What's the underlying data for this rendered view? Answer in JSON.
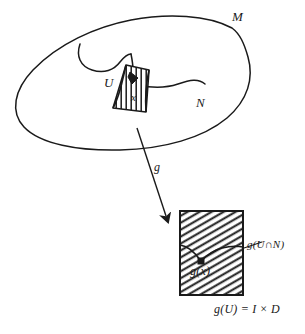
{
  "figure": {
    "title_present": false,
    "background_color": "#ffffff",
    "ink_color": "#1a1a1a",
    "width": 305,
    "height": 334
  },
  "labels": {
    "manifold": "M",
    "submanifold": "N",
    "chart_domain": "U",
    "point": "x",
    "map": "g",
    "image_point": "g(x)",
    "image_intersection": "g(U∩N)",
    "image_equation": "g(U) = I × D"
  },
  "shapes": {
    "manifold_blob": "closed-freehand-blob",
    "chart_patch": "hatched-quadrilateral",
    "image_rectangle": "hatched-rectangle",
    "map_arrow": "downward-arrow",
    "leader_line": "pointer-from-label-to-curve"
  }
}
